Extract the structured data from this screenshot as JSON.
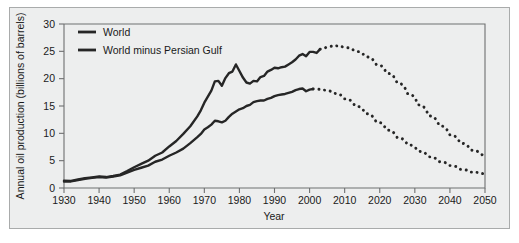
{
  "figure": {
    "background_color": "#edeeee",
    "frame_color": "#a9abab",
    "line_color": "#262626"
  },
  "chart_data": {
    "type": "line",
    "title": "",
    "xlabel": "Year",
    "ylabel": "Annual oil production (billions of barrels)",
    "xlim": [
      1930,
      2050
    ],
    "ylim": [
      0,
      30
    ],
    "xticks": [
      1930,
      1940,
      1950,
      1960,
      1970,
      1980,
      1990,
      2000,
      2010,
      2020,
      2030,
      2040,
      2050
    ],
    "yticks": [
      0,
      5,
      10,
      15,
      20,
      25,
      30
    ],
    "grid": false,
    "legend_position": "top-left",
    "series": [
      {
        "name": "World",
        "style": "solid-then-dotted",
        "historical": [
          [
            1930,
            1.35
          ],
          [
            1932,
            1.3
          ],
          [
            1934,
            1.55
          ],
          [
            1936,
            1.8
          ],
          [
            1938,
            1.95
          ],
          [
            1940,
            2.1
          ],
          [
            1942,
            2.0
          ],
          [
            1944,
            2.2
          ],
          [
            1946,
            2.45
          ],
          [
            1948,
            3.1
          ],
          [
            1950,
            3.8
          ],
          [
            1952,
            4.4
          ],
          [
            1954,
            5.0
          ],
          [
            1956,
            5.9
          ],
          [
            1958,
            6.5
          ],
          [
            1960,
            7.6
          ],
          [
            1962,
            8.6
          ],
          [
            1964,
            9.9
          ],
          [
            1966,
            11.3
          ],
          [
            1968,
            13.1
          ],
          [
            1969,
            14.2
          ],
          [
            1970,
            15.6
          ],
          [
            1971,
            16.7
          ],
          [
            1972,
            17.8
          ],
          [
            1973,
            19.5
          ],
          [
            1974,
            19.6
          ],
          [
            1975,
            18.7
          ],
          [
            1976,
            20.1
          ],
          [
            1977,
            21.0
          ],
          [
            1978,
            21.3
          ],
          [
            1979,
            22.6
          ],
          [
            1980,
            21.4
          ],
          [
            1981,
            20.2
          ],
          [
            1982,
            19.3
          ],
          [
            1983,
            19.1
          ],
          [
            1984,
            19.6
          ],
          [
            1985,
            19.5
          ],
          [
            1986,
            20.3
          ],
          [
            1987,
            20.5
          ],
          [
            1988,
            21.3
          ],
          [
            1989,
            21.6
          ],
          [
            1990,
            22.0
          ],
          [
            1991,
            21.9
          ],
          [
            1992,
            22.1
          ],
          [
            1993,
            22.2
          ],
          [
            1994,
            22.6
          ],
          [
            1995,
            23.0
          ],
          [
            1996,
            23.5
          ],
          [
            1997,
            24.2
          ],
          [
            1998,
            24.5
          ],
          [
            1999,
            24.1
          ],
          [
            2000,
            24.9
          ],
          [
            2001,
            24.9
          ],
          [
            2002,
            24.7
          ],
          [
            2003,
            25.4
          ]
        ],
        "projected": [
          [
            2003,
            25.4
          ],
          [
            2005,
            25.9
          ],
          [
            2007,
            26.0
          ],
          [
            2010,
            25.7
          ],
          [
            2013,
            25.0
          ],
          [
            2016,
            24.0
          ],
          [
            2019,
            22.6
          ],
          [
            2022,
            21.0
          ],
          [
            2025,
            19.2
          ],
          [
            2028,
            17.2
          ],
          [
            2031,
            15.2
          ],
          [
            2034,
            13.2
          ],
          [
            2037,
            11.4
          ],
          [
            2040,
            9.7
          ],
          [
            2043,
            8.2
          ],
          [
            2046,
            6.9
          ],
          [
            2050,
            5.5
          ]
        ]
      },
      {
        "name": "World minus Persian Gulf",
        "style": "solid-then-dotted",
        "historical": [
          [
            1930,
            1.2
          ],
          [
            1932,
            1.2
          ],
          [
            1934,
            1.45
          ],
          [
            1936,
            1.7
          ],
          [
            1938,
            1.85
          ],
          [
            1940,
            2.0
          ],
          [
            1942,
            1.9
          ],
          [
            1944,
            2.1
          ],
          [
            1946,
            2.3
          ],
          [
            1948,
            2.8
          ],
          [
            1950,
            3.3
          ],
          [
            1952,
            3.7
          ],
          [
            1954,
            4.1
          ],
          [
            1956,
            4.8
          ],
          [
            1958,
            5.2
          ],
          [
            1960,
            5.9
          ],
          [
            1962,
            6.5
          ],
          [
            1964,
            7.2
          ],
          [
            1966,
            8.2
          ],
          [
            1968,
            9.3
          ],
          [
            1969,
            9.9
          ],
          [
            1970,
            10.7
          ],
          [
            1971,
            11.1
          ],
          [
            1972,
            11.6
          ],
          [
            1973,
            12.3
          ],
          [
            1974,
            12.2
          ],
          [
            1975,
            12.0
          ],
          [
            1976,
            12.3
          ],
          [
            1977,
            13.0
          ],
          [
            1978,
            13.6
          ],
          [
            1979,
            14.0
          ],
          [
            1980,
            14.4
          ],
          [
            1981,
            14.6
          ],
          [
            1982,
            15.0
          ],
          [
            1983,
            15.2
          ],
          [
            1984,
            15.7
          ],
          [
            1985,
            15.9
          ],
          [
            1986,
            16.0
          ],
          [
            1987,
            16.0
          ],
          [
            1988,
            16.3
          ],
          [
            1989,
            16.5
          ],
          [
            1990,
            16.8
          ],
          [
            1991,
            17.0
          ],
          [
            1992,
            17.1
          ],
          [
            1993,
            17.2
          ],
          [
            1994,
            17.4
          ],
          [
            1995,
            17.6
          ],
          [
            1996,
            17.9
          ],
          [
            1997,
            18.1
          ],
          [
            1998,
            18.2
          ],
          [
            1999,
            17.7
          ],
          [
            2000,
            18.0
          ],
          [
            2001,
            18.1
          ]
        ],
        "projected": [
          [
            2001,
            18.1
          ],
          [
            2004,
            17.9
          ],
          [
            2007,
            17.3
          ],
          [
            2010,
            16.3
          ],
          [
            2013,
            15.0
          ],
          [
            2016,
            13.6
          ],
          [
            2019,
            12.1
          ],
          [
            2022,
            10.6
          ],
          [
            2025,
            9.2
          ],
          [
            2028,
            7.9
          ],
          [
            2031,
            6.7
          ],
          [
            2034,
            5.7
          ],
          [
            2037,
            4.8
          ],
          [
            2040,
            4.1
          ],
          [
            2043,
            3.4
          ],
          [
            2046,
            2.9
          ],
          [
            2050,
            2.5
          ]
        ]
      }
    ]
  },
  "legend": {
    "items": [
      {
        "label": "World"
      },
      {
        "label": "World minus Persian Gulf"
      }
    ]
  }
}
